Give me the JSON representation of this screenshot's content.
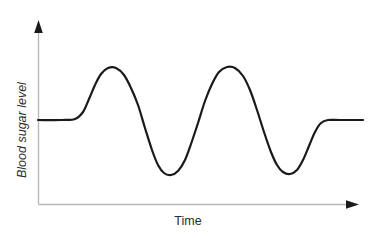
{
  "figure": {
    "background_color": "#ffffff",
    "width": 374,
    "height": 238
  },
  "labels": {
    "y_axis": "Blood  sugar  level",
    "x_axis": "Time"
  },
  "axes": {
    "color": "#b9b9b9",
    "arrow_color": "#1a1a1a",
    "origin_x": 38,
    "origin_y": 204,
    "y_top": 22,
    "x_right": 358
  },
  "curve": {
    "color": "#1a1a1a",
    "width": 2.2
  },
  "chart_data": {
    "type": "line",
    "title": "",
    "xlabel": "Time",
    "ylabel": "Blood  sugar  level",
    "grid": false,
    "legend": "none",
    "xlim": [
      0,
      374
    ],
    "ylim": [
      238,
      0
    ],
    "series": [
      {
        "name": "Blood sugar level",
        "description": "Baseline plateau, two large oscillating peaks with deep troughs between them, returning to baseline plateau",
        "points": [
          [
            38,
            120
          ],
          [
            62,
            120
          ],
          [
            75,
            119
          ],
          [
            83,
            112
          ],
          [
            89,
            99
          ],
          [
            95,
            85
          ],
          [
            101,
            74
          ],
          [
            108,
            68
          ],
          [
            116,
            68
          ],
          [
            124,
            75
          ],
          [
            131,
            88
          ],
          [
            138,
            105
          ],
          [
            145,
            128
          ],
          [
            152,
            150
          ],
          [
            158,
            165
          ],
          [
            164,
            173
          ],
          [
            171,
            175
          ],
          [
            178,
            171
          ],
          [
            185,
            160
          ],
          [
            191,
            144
          ],
          [
            198,
            123
          ],
          [
            205,
            101
          ],
          [
            212,
            84
          ],
          [
            219,
            72
          ],
          [
            227,
            67
          ],
          [
            235,
            68
          ],
          [
            243,
            76
          ],
          [
            250,
            90
          ],
          [
            257,
            110
          ],
          [
            264,
            132
          ],
          [
            271,
            152
          ],
          [
            277,
            165
          ],
          [
            283,
            172
          ],
          [
            290,
            174
          ],
          [
            297,
            170
          ],
          [
            303,
            160
          ],
          [
            309,
            146
          ],
          [
            315,
            132
          ],
          [
            321,
            123
          ],
          [
            328,
            120
          ],
          [
            340,
            120
          ],
          [
            363,
            120
          ]
        ],
        "annotations": {
          "peak_1": [
            108,
            68
          ],
          "trough_1": [
            167,
            174
          ],
          "peak_2": [
            228,
            67
          ],
          "trough_2": [
            286,
            173
          ],
          "start_baseline_y": 120,
          "end_baseline_y": 120
        }
      }
    ]
  }
}
